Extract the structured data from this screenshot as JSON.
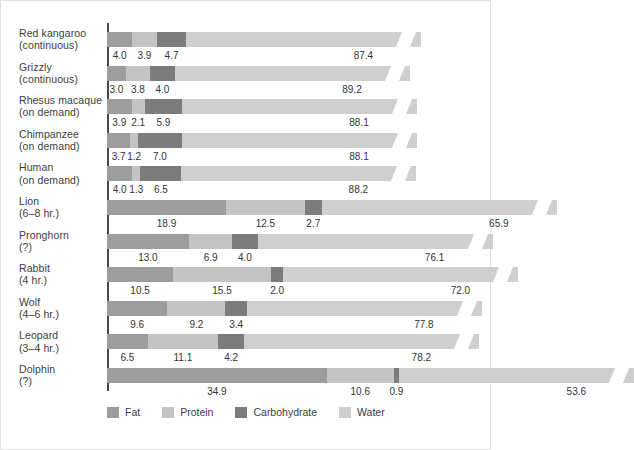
{
  "chart_data": {
    "type": "bar",
    "title": "",
    "subtitle": "",
    "xlabel": "",
    "ylabel": "",
    "stacked": true,
    "orientation": "horizontal",
    "grid": false,
    "axis_break": true,
    "axis_break_note": "Water bars are broken near the right edge to compress the axis",
    "legend_position": "bottom",
    "legend": [
      "Fat",
      "Protein",
      "Carbohydrate",
      "Water"
    ],
    "series_colors": {
      "Fat": "#9d9d9d",
      "Protein": "#c4c4c4",
      "Carbohydrate": "#7c7c7c",
      "Water": "#cfcfcf"
    },
    "categories": [
      "Red kangaroo (continuous)",
      "Grizzly (continuous)",
      "Rhesus macaque (on demand)",
      "Chimpanzee (on demand)",
      "Human (on demand)",
      "Lion (6–8 hr.)",
      "Pronghorn (?)",
      "Rabbit (4 hr.)",
      "Wolf (4–6 hr.)",
      "Leopard (3–4 hr.)",
      "Dolphin (?)"
    ],
    "series": [
      {
        "name": "Fat",
        "values": [
          4.0,
          3.0,
          3.9,
          3.7,
          4.0,
          18.9,
          13.0,
          10.5,
          9.6,
          6.5,
          34.9
        ]
      },
      {
        "name": "Protein",
        "values": [
          3.9,
          3.8,
          2.1,
          1.2,
          1.3,
          12.5,
          6.9,
          15.5,
          9.2,
          11.1,
          10.6
        ]
      },
      {
        "name": "Carbohydrate",
        "values": [
          4.7,
          4.0,
          5.9,
          7.0,
          6.5,
          2.7,
          4.0,
          2.0,
          3.4,
          4.2,
          0.9
        ]
      },
      {
        "name": "Water",
        "values": [
          87.4,
          89.2,
          88.1,
          88.1,
          88.2,
          65.9,
          76.1,
          72.0,
          77.8,
          78.2,
          53.6
        ]
      }
    ]
  },
  "rows": [
    {
      "line1": "Red kangaroo",
      "line2": "(continuous)",
      "fat": "4.0",
      "protein": "3.9",
      "carb": "4.7",
      "water": "87.4"
    },
    {
      "line1": "Grizzly",
      "line2": "(continuous)",
      "fat": "3.0",
      "protein": "3.8",
      "carb": "4.0",
      "water": "89.2"
    },
    {
      "line1": "Rhesus macaque",
      "line2": "(on demand)",
      "fat": "3.9",
      "protein": "2.1",
      "carb": "5.9",
      "water": "88.1"
    },
    {
      "line1": "Chimpanzee",
      "line2": "(on demand)",
      "fat": "3.7",
      "protein": "1.2",
      "carb": "7.0",
      "water": "88.1"
    },
    {
      "line1": "Human",
      "line2": "(on demand)",
      "fat": "4.0",
      "protein": "1.3",
      "carb": "6.5",
      "water": "88.2"
    },
    {
      "line1": "Lion",
      "line2": "(6–8 hr.)",
      "fat": "18.9",
      "protein": "12.5",
      "carb": "2.7",
      "water": "65.9"
    },
    {
      "line1": "Pronghorn",
      "line2": "(?)",
      "fat": "13.0",
      "protein": "6.9",
      "carb": "4.0",
      "water": "76.1"
    },
    {
      "line1": "Rabbit",
      "line2": "(4 hr.)",
      "fat": "10.5",
      "protein": "15.5",
      "carb": "2.0",
      "water": "72.0"
    },
    {
      "line1": "Wolf",
      "line2": "(4–6 hr.)",
      "fat": "9.6",
      "protein": "9.2",
      "carb": "3.4",
      "water": "77.8"
    },
    {
      "line1": "Leopard",
      "line2": "(3–4 hr.)",
      "fat": "6.5",
      "protein": "11.1",
      "carb": "4.2",
      "water": "78.2"
    },
    {
      "line1": "Dolphin",
      "line2": "(?)",
      "fat": "34.9",
      "protein": "10.6",
      "carb": "0.9",
      "water": "53.6"
    }
  ],
  "legend": {
    "fat": "Fat",
    "protein": "Protein",
    "carbohydrate": "Carbohydrate",
    "water": "Water"
  }
}
